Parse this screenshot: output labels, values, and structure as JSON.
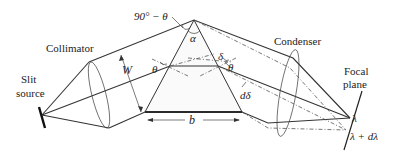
{
  "figure": {
    "type": "prism spectrometer schematic",
    "labels": {
      "slit_line1": "Slit",
      "slit_line2": "source",
      "collimator": "Collimator",
      "condenser": "Condenser",
      "focal_line1": "Focal",
      "focal_line2": "plane",
      "apex_angle_complement": "90° − θ",
      "apex_angle": "α",
      "beam_width": "W",
      "base_length": "b",
      "incidence_angle": "θ",
      "exit_angle": "θ",
      "deviation": "δ",
      "deviation_increment": "dδ",
      "wavelength": "λ",
      "wavelength_shifted": "λ + dλ"
    },
    "colors": {
      "line": "#333333",
      "dashed": "#555555",
      "text": "#222222",
      "background": "#ffffff"
    }
  }
}
